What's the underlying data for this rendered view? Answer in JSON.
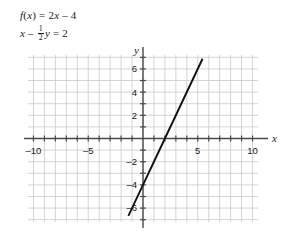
{
  "equations": [
    {
      "id": "eq-function",
      "text": "f(x) = 2x – 4"
    },
    {
      "id": "eq-standard",
      "text": "x – 1/2 y = 2"
    }
  ],
  "equation_parts": {
    "eq1_f": "f",
    "eq1_paren_open": "(",
    "eq1_x": "x",
    "eq1_paren_close": ")",
    "eq1_equals": " = 2",
    "eq1_x2": "x",
    "eq1_tail": " – 4",
    "eq2_x": "x",
    "eq2_minus": " – ",
    "eq2_num": "1",
    "eq2_den": "2",
    "eq2_y": "y",
    "eq2_tail": " = 2"
  },
  "chart_data": {
    "type": "line",
    "title": "",
    "xlabel": "x",
    "ylabel": "y",
    "xlim": [
      -10.5,
      10.5
    ],
    "ylim": [
      -7.2,
      7.2
    ],
    "grid": true,
    "grid_step": 1,
    "legend": "none",
    "x_tick_labels": [
      {
        "value": -10,
        "label": "–10"
      },
      {
        "value": -5,
        "label": "–5"
      },
      {
        "value": 5,
        "label": "5"
      },
      {
        "value": 10,
        "label": "10"
      }
    ],
    "y_tick_labels": [
      {
        "value": 6,
        "label": "6"
      },
      {
        "value": 4,
        "label": "4"
      },
      {
        "value": 2,
        "label": "2"
      },
      {
        "value": -2,
        "label": "–2"
      },
      {
        "value": -4,
        "label": "–4"
      },
      {
        "value": -6,
        "label": "–6"
      }
    ],
    "series": [
      {
        "name": "f(x) = 2x - 4",
        "equation": "y = 2x - 4",
        "slope": 2,
        "y_intercept": -4,
        "x_intercept": 2,
        "points": [
          {
            "x": -1.3,
            "y": -6.6
          },
          {
            "x": 0,
            "y": -4
          },
          {
            "x": 2,
            "y": 0
          },
          {
            "x": 5.4,
            "y": 6.8
          }
        ],
        "color": "#111111"
      }
    ]
  },
  "colors": {
    "grid": "#c9c9ce",
    "axis": "#4a4a4a",
    "line": "#111111",
    "text": "#1a1a1a",
    "background": "#ffffff"
  }
}
